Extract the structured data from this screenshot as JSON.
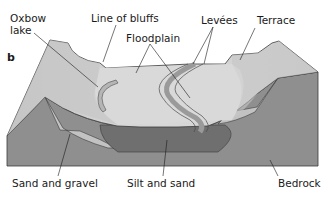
{
  "figure": {
    "panel_letter": "b",
    "colors": {
      "surface": "#cfcfcf",
      "surface_light": "#dadada",
      "surface_shade": "#b8b8b8",
      "bedrock": "#8f8f8f",
      "silt_and_sand": "#6f6f6f",
      "sand_and_gravel": "#c2c2c2",
      "outline": "#3a3a3a"
    },
    "labels": {
      "oxbow_lake": [
        "Oxbow",
        "lake"
      ],
      "line_of_bluffs": "Line of bluffs",
      "floodplain": "Floodplain",
      "levees": "Levées",
      "terrace": "Terrace",
      "sand_and_gravel": "Sand and gravel",
      "silt_and_sand": "Silt and sand",
      "bedrock": "Bedrock"
    }
  }
}
